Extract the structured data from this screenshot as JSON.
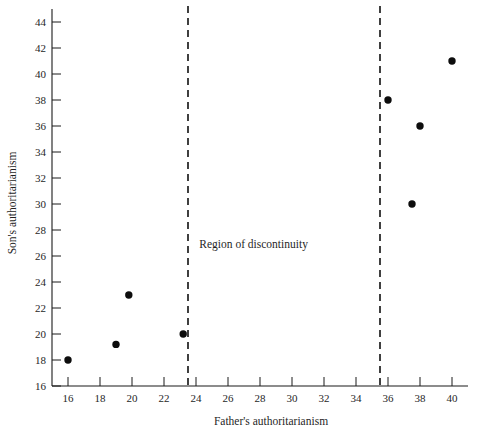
{
  "figure": {
    "background_color": "#ffffff",
    "point_color": "#0d0d0d",
    "axis_color": "#1a1a1a"
  },
  "chart_data": {
    "type": "scatter",
    "title": "",
    "xlabel": "Father's authoritarianism",
    "ylabel": "Son's authoritarianism",
    "xlim": [
      15,
      41
    ],
    "ylim": [
      16,
      45
    ],
    "grid": false,
    "legend": null,
    "xticks": [
      16,
      18,
      20,
      22,
      24,
      26,
      28,
      30,
      32,
      34,
      36,
      38,
      40
    ],
    "yticks": [
      16,
      18,
      20,
      22,
      24,
      26,
      28,
      30,
      32,
      34,
      36,
      38,
      40,
      42,
      44
    ],
    "xtick_labels": [
      "16",
      "18",
      "20",
      "22",
      "24",
      "26",
      "28",
      "30",
      "32",
      "34",
      "36",
      "38",
      "40"
    ],
    "ytick_labels": [
      "16",
      "18",
      "20",
      "22",
      "24",
      "26",
      "28",
      "30",
      "32",
      "34",
      "36",
      "38",
      "40",
      "42",
      "44"
    ],
    "points": [
      {
        "x": 16.0,
        "y": 18.0
      },
      {
        "x": 19.0,
        "y": 19.2
      },
      {
        "x": 19.8,
        "y": 23.0
      },
      {
        "x": 23.2,
        "y": 20.0
      },
      {
        "x": 36.0,
        "y": 38.0
      },
      {
        "x": 37.5,
        "y": 30.0
      },
      {
        "x": 38.0,
        "y": 36.0
      },
      {
        "x": 40.0,
        "y": 41.0
      }
    ],
    "annotations": [
      {
        "text": "Region of discontinuity",
        "x": 27.6,
        "y": 26.6,
        "name": "region-of-discontinuity-label"
      }
    ],
    "vertical_lines": [
      {
        "x": 23.5,
        "style": "dashed",
        "name": "cutoff-line-lower"
      },
      {
        "x": 35.5,
        "style": "dashed",
        "name": "cutoff-line-upper"
      }
    ]
  }
}
